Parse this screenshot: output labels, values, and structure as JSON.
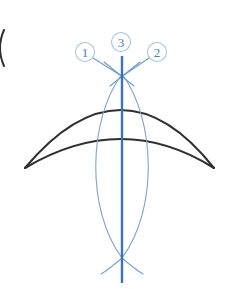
{
  "figure": {
    "canvas": {
      "width": 239,
      "height": 289,
      "background": "#ffffff"
    },
    "colors": {
      "outline_black": "#2f2f2f",
      "axis_blue": "#3b72b8",
      "arc_blue": "#7ba3d0",
      "callout_blue": "#4a7fbd",
      "callout_ring": "#a7c4e0",
      "leader_blue": "#6c9ccb",
      "background": "#ffffff"
    },
    "callouts": [
      {
        "id": "callout-1",
        "label": "1",
        "cx": 85,
        "cy": 52,
        "r": 9.5,
        "leader": {
          "x1": 93,
          "y1": 58,
          "x2": 120,
          "y2": 75
        }
      },
      {
        "id": "callout-3",
        "label": "3",
        "cx": 121,
        "cy": 42,
        "r": 9.5,
        "leader": null
      },
      {
        "id": "callout-2",
        "label": "2",
        "cx": 157,
        "cy": 52,
        "r": 9.5,
        "leader": {
          "x1": 149,
          "y1": 58,
          "x2": 124,
          "y2": 75
        }
      }
    ],
    "shapes": {
      "crescent_outer_arc": {
        "name": "outer-crescent-arc",
        "path": "M 25 168 Q 122 52 214 168",
        "stroke": "#2f2f2f"
      },
      "crescent_inner_arc": {
        "name": "inner-crescent-arc",
        "path": "M 25 168 Q 122 110 214 168",
        "stroke": "#2f2f2f"
      },
      "lens_left_arc": {
        "name": "lens-left-arc",
        "path": "M 122 74 C 88 120 86 210 122 258",
        "stroke": "#7ba3d0"
      },
      "lens_right_arc": {
        "name": "lens-right-arc",
        "path": "M 122 74 C 156 120 158 210 122 258",
        "stroke": "#7ba3d0"
      },
      "lens_tail_left": {
        "name": "lens-tail-left-arc",
        "path": "M 122 258 C 115 264 108 270 101 274",
        "stroke": "#7ba3d0"
      },
      "lens_tail_right": {
        "name": "lens-tail-right-arc",
        "path": "M 122 258 C 129 264 136 270 143 274",
        "stroke": "#7ba3d0"
      },
      "vertical_axis": {
        "name": "vertical-axis-line",
        "x1": 122,
        "y1": 56,
        "x2": 122,
        "y2": 283,
        "stroke": "#3b72b8"
      },
      "cross_tick_left": {
        "name": "intersection-tick-left",
        "path": "M 104 62 L 134 86",
        "stroke": "#6c9ccb"
      },
      "cross_tick_right": {
        "name": "intersection-tick-right",
        "path": "M 140 62 L 110 86",
        "stroke": "#6c9ccb"
      },
      "edge_paren": {
        "name": "left-edge-partial-mark",
        "path": "M 4 30 Q -4 48 4 66",
        "stroke": "#2f2f2f"
      }
    }
  }
}
